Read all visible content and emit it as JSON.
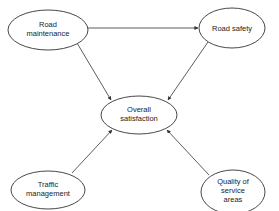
{
  "diagram": {
    "type": "path-model",
    "nodes": [
      {
        "id": "road_maintenance",
        "lines": [
          "Road",
          "maintenance"
        ],
        "cx": 48,
        "cy": 30,
        "rx": 40,
        "ry": 20
      },
      {
        "id": "road_safety",
        "lines": [
          "Road safety"
        ],
        "cx": 232,
        "cy": 28,
        "rx": 33,
        "ry": 20
      },
      {
        "id": "overall_satisfaction",
        "lines": [
          "Overall",
          "satisfaction"
        ],
        "cx": 139,
        "cy": 115,
        "rx": 38,
        "ry": 19
      },
      {
        "id": "traffic_management",
        "lines": [
          "Traffic",
          "management"
        ],
        "cx": 48,
        "cy": 190,
        "rx": 37,
        "ry": 19
      },
      {
        "id": "quality_service_areas",
        "lines": [
          "Quality of",
          "service",
          "areas"
        ],
        "cx": 233,
        "cy": 192,
        "rx": 32,
        "ry": 22
      }
    ],
    "edges": [
      {
        "from": "road_maintenance",
        "to": "road_safety"
      },
      {
        "from": "road_maintenance",
        "to": "overall_satisfaction"
      },
      {
        "from": "road_safety",
        "to": "overall_satisfaction"
      },
      {
        "from": "traffic_management",
        "to": "overall_satisfaction"
      },
      {
        "from": "quality_service_areas",
        "to": "overall_satisfaction"
      }
    ]
  },
  "labels": {
    "road_maintenance": {
      "line1": "Road",
      "line2": "maintenance"
    },
    "road_safety": {
      "line1": "Road safety"
    },
    "overall_satisfaction": {
      "line1": "Overall",
      "line2": "satisfaction"
    },
    "traffic_management": {
      "line1": "Traffic",
      "line2": "management"
    },
    "quality_service_areas": {
      "line1": "Quality of",
      "line2": "service",
      "line3": "areas"
    }
  }
}
